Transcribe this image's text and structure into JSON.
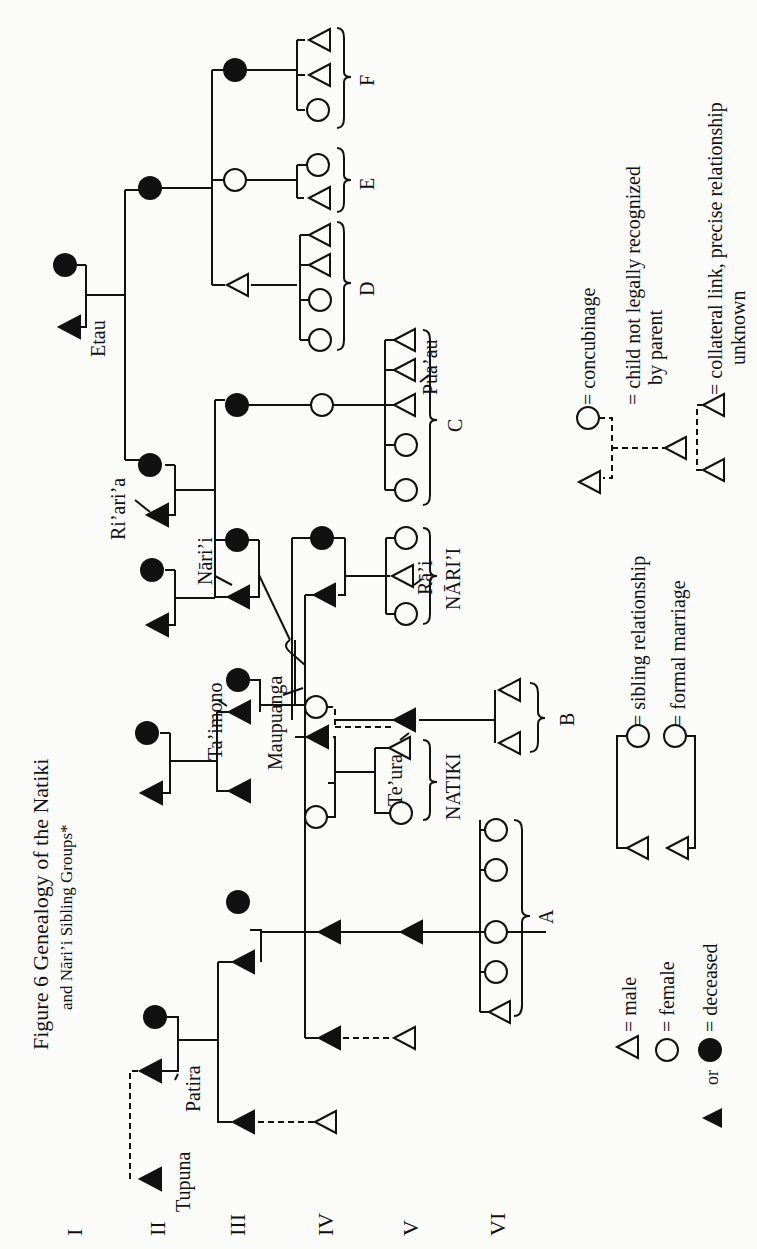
{
  "title": {
    "line1": "Figure 6   Genealogy of the Natiki",
    "line2": "and Nāri’i Sibling Groups*"
  },
  "generations": [
    "I",
    "II",
    "III",
    "IV",
    "V",
    "VI"
  ],
  "names": {
    "tupuna": "Tupuna",
    "patira": "Patira",
    "taimono": "Ta’imono",
    "maupuanga": "Maupuanga",
    "narii": "Nāri’i",
    "riaria": "Ri’ari’a",
    "etau": "Etau",
    "teura": "Te’ura",
    "rai": "Rā’i",
    "puaau": "Pua’au"
  },
  "groups": {
    "A": "A",
    "B": "B",
    "C": "C",
    "D": "D",
    "E": "E",
    "F": "F",
    "natiki": "NATIKI",
    "narii": "NĀRI’I"
  },
  "legend": {
    "male": "= male",
    "female": "= female",
    "or": "or",
    "deceased": "= deceased",
    "sibling": "= sibling relationship",
    "marriage": "= formal marriage",
    "concubinage": "= concubinage",
    "not_recognized_1": "= child not legally recognized",
    "not_recognized_2": "by parent",
    "collateral_1": "= collateral link, precise relationship",
    "collateral_2": "unknown"
  }
}
